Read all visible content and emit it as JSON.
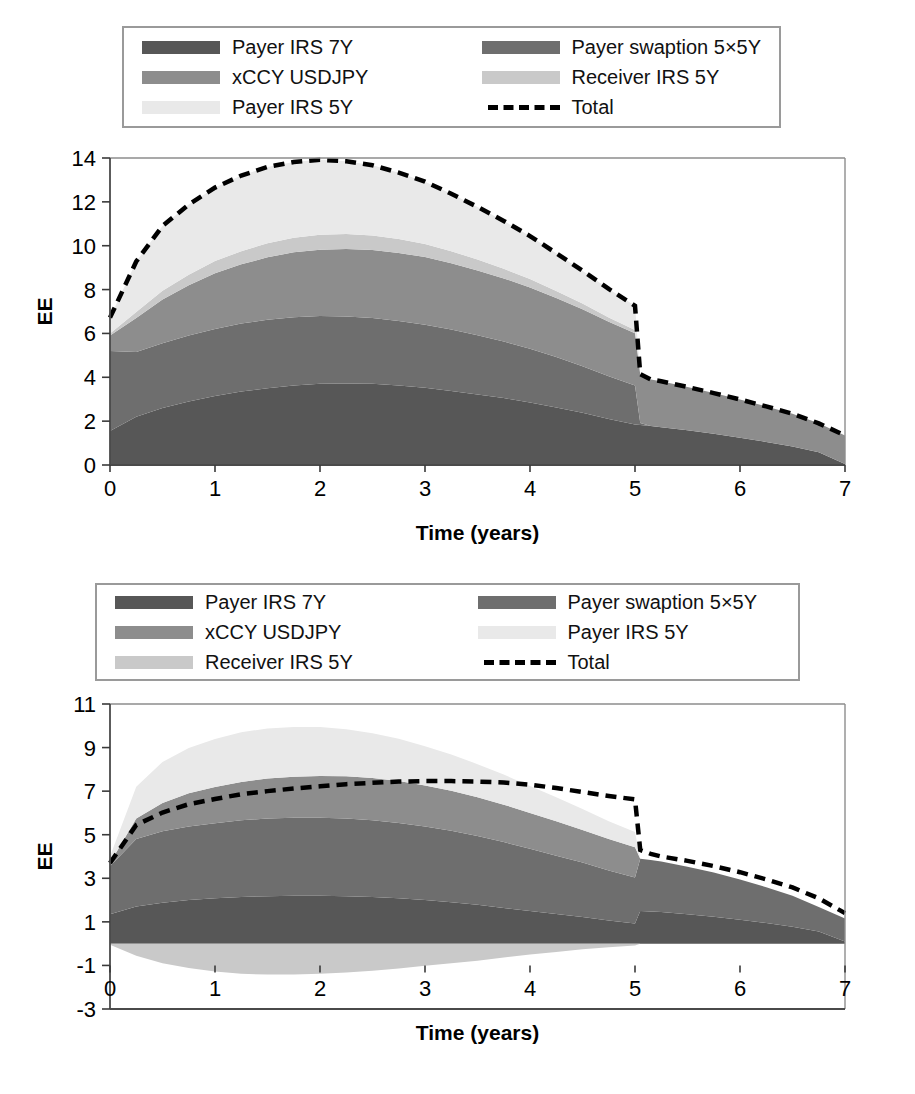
{
  "figure": {
    "axis_x_title": "Time (years)",
    "axis_y_title": "EE",
    "colors": {
      "payer_irs_7y": "#575757",
      "payer_swaption_5x5y": "#6e6e6e",
      "xccy_usdjpy": "#8d8d8d",
      "receiver_irs_5y": "#c9c9c9",
      "payer_irs_5y": "#e9e9e9",
      "total_line": "#000000",
      "frame": "#8d8d8d"
    }
  },
  "legend_top": {
    "items": [
      {
        "label": "Payer IRS 7Y",
        "swatch": "payer_irs_7y",
        "type": "fill"
      },
      {
        "label": "Payer swaption 5×5Y",
        "swatch": "payer_swaption_5x5y",
        "type": "fill"
      },
      {
        "label": "xCCY USDJPY",
        "swatch": "xccy_usdjpy",
        "type": "fill"
      },
      {
        "label": "Receiver IRS 5Y",
        "swatch": "receiver_irs_5y",
        "type": "fill"
      },
      {
        "label": "Payer IRS 5Y",
        "swatch": "payer_irs_5y",
        "type": "fill"
      },
      {
        "label": "Total",
        "swatch": "total_line",
        "type": "dashed-line"
      }
    ]
  },
  "legend_bottom": {
    "items": [
      {
        "label": "Payer IRS 7Y",
        "swatch": "payer_irs_7y",
        "type": "fill"
      },
      {
        "label": "Payer swaption 5×5Y",
        "swatch": "payer_swaption_5x5y",
        "type": "fill"
      },
      {
        "label": "xCCY USDJPY",
        "swatch": "xccy_usdjpy",
        "type": "fill"
      },
      {
        "label": "Payer IRS 5Y",
        "swatch": "payer_irs_5y",
        "type": "fill"
      },
      {
        "label": "Receiver IRS 5Y",
        "swatch": "receiver_irs_5y",
        "type": "fill"
      },
      {
        "label": "Total",
        "swatch": "total_line",
        "type": "dashed-line"
      }
    ]
  },
  "chart_data": [
    {
      "id": "chart-top",
      "type": "area",
      "stacked": true,
      "title": "",
      "xlabel": "Time (years)",
      "ylabel": "EE",
      "grid": false,
      "legend_position": "top",
      "xlim": [
        0,
        7
      ],
      "ylim": [
        0,
        14
      ],
      "xticks": [
        0,
        1,
        2,
        3,
        4,
        5,
        6,
        7
      ],
      "yticks": [
        0,
        2,
        4,
        6,
        8,
        10,
        12,
        14
      ],
      "x": [
        0,
        0.25,
        0.5,
        0.75,
        1.0,
        1.25,
        1.5,
        1.75,
        2.0,
        2.25,
        2.5,
        2.75,
        3.0,
        3.25,
        3.5,
        3.75,
        4.0,
        4.25,
        4.5,
        4.75,
        5.0,
        5.05,
        5.15,
        5.25,
        5.5,
        5.75,
        6.0,
        6.25,
        6.5,
        6.75,
        7.0
      ],
      "series": [
        {
          "name": "Payer IRS 7Y",
          "color_key": "payer_irs_7y",
          "values": [
            1.55,
            2.2,
            2.6,
            2.9,
            3.15,
            3.35,
            3.5,
            3.62,
            3.7,
            3.72,
            3.7,
            3.62,
            3.52,
            3.38,
            3.22,
            3.05,
            2.85,
            2.62,
            2.38,
            2.1,
            1.85,
            1.82,
            1.78,
            1.72,
            1.58,
            1.42,
            1.24,
            1.05,
            0.84,
            0.58,
            0.05
          ]
        },
        {
          "name": "Payer swaption 5×5Y",
          "color_key": "payer_swaption_5x5y",
          "values": [
            3.65,
            2.95,
            2.95,
            3.0,
            3.05,
            3.1,
            3.12,
            3.12,
            3.1,
            3.05,
            3.0,
            2.95,
            2.88,
            2.8,
            2.7,
            2.58,
            2.45,
            2.3,
            2.12,
            1.95,
            1.78,
            0.1,
            0.0,
            0.0,
            0.0,
            0.0,
            0.0,
            0.0,
            0.0,
            0.0,
            0.0
          ]
        },
        {
          "name": "xCCY USDJPY",
          "color_key": "xccy_usdjpy",
          "values": [
            0.7,
            1.55,
            2.0,
            2.3,
            2.55,
            2.7,
            2.85,
            2.96,
            3.02,
            3.08,
            3.1,
            3.1,
            3.08,
            3.02,
            2.95,
            2.88,
            2.8,
            2.7,
            2.6,
            2.48,
            2.38,
            2.22,
            2.12,
            2.1,
            1.98,
            1.86,
            1.75,
            1.62,
            1.5,
            1.32,
            1.3
          ]
        },
        {
          "name": "Receiver IRS 5Y",
          "color_key": "receiver_irs_5y",
          "values": [
            0.1,
            0.28,
            0.4,
            0.48,
            0.55,
            0.6,
            0.64,
            0.66,
            0.68,
            0.68,
            0.67,
            0.64,
            0.6,
            0.55,
            0.5,
            0.44,
            0.38,
            0.32,
            0.26,
            0.2,
            0.15,
            0.0,
            0.0,
            0.0,
            0.0,
            0.0,
            0.0,
            0.0,
            0.0,
            0.0,
            0.0
          ]
        },
        {
          "name": "Payer IRS 5Y",
          "color_key": "payer_irs_5y",
          "values": [
            0.72,
            2.3,
            2.95,
            3.2,
            3.35,
            3.45,
            3.48,
            3.46,
            3.42,
            3.32,
            3.2,
            3.02,
            2.84,
            2.62,
            2.4,
            2.18,
            1.96,
            1.72,
            1.5,
            1.3,
            1.1,
            0.0,
            0.0,
            0.0,
            0.0,
            0.0,
            0.0,
            0.0,
            0.0,
            0.0,
            0.0
          ]
        }
      ],
      "total": {
        "name": "Total",
        "style": "dashed",
        "values": [
          6.72,
          9.28,
          10.9,
          11.88,
          12.65,
          13.2,
          13.59,
          13.82,
          13.92,
          13.85,
          13.67,
          13.33,
          12.92,
          12.37,
          11.77,
          11.13,
          10.44,
          9.66,
          8.86,
          8.03,
          7.26,
          4.14,
          3.9,
          3.82,
          3.56,
          3.28,
          2.99,
          2.67,
          2.34,
          1.9,
          1.35
        ]
      }
    },
    {
      "id": "chart-bottom",
      "type": "area",
      "stacked": true,
      "title": "",
      "xlabel": "Time (years)",
      "ylabel": "EE",
      "grid": false,
      "legend_position": "top",
      "xlim": [
        0,
        7
      ],
      "ylim": [
        -3,
        11
      ],
      "xticks": [
        0,
        1,
        2,
        3,
        4,
        5,
        6,
        7
      ],
      "yticks": [
        -3,
        -1,
        1,
        3,
        5,
        7,
        9,
        11
      ],
      "x": [
        0,
        0.25,
        0.5,
        0.75,
        1.0,
        1.25,
        1.5,
        1.75,
        2.0,
        2.25,
        2.5,
        2.75,
        3.0,
        3.25,
        3.5,
        3.75,
        4.0,
        4.25,
        4.5,
        4.75,
        5.0,
        5.05,
        5.15,
        5.25,
        5.5,
        5.75,
        6.0,
        6.25,
        6.5,
        6.75,
        7.0
      ],
      "series": [
        {
          "name": "Payer IRS 7Y",
          "color_key": "payer_irs_7y",
          "values": [
            1.35,
            1.7,
            1.88,
            2.0,
            2.08,
            2.14,
            2.18,
            2.2,
            2.2,
            2.18,
            2.14,
            2.08,
            2.0,
            1.9,
            1.78,
            1.64,
            1.5,
            1.36,
            1.22,
            1.06,
            0.92,
            1.5,
            1.48,
            1.45,
            1.35,
            1.24,
            1.1,
            0.95,
            0.78,
            0.56,
            0.1
          ]
        },
        {
          "name": "Payer swaption 5×5Y",
          "color_key": "payer_swaption_5x5y",
          "values": [
            2.2,
            3.1,
            3.28,
            3.38,
            3.45,
            3.52,
            3.56,
            3.58,
            3.58,
            3.56,
            3.52,
            3.46,
            3.38,
            3.28,
            3.16,
            3.02,
            2.86,
            2.68,
            2.5,
            2.3,
            2.12,
            2.4,
            2.36,
            2.32,
            2.18,
            2.02,
            1.84,
            1.64,
            1.42,
            1.12,
            1.05
          ]
        },
        {
          "name": "xCCY USDJPY",
          "color_key": "xccy_usdjpy",
          "values": [
            0.15,
            0.95,
            1.3,
            1.52,
            1.66,
            1.76,
            1.84,
            1.88,
            1.92,
            1.94,
            1.94,
            1.92,
            1.88,
            1.84,
            1.78,
            1.72,
            1.64,
            1.58,
            1.5,
            1.44,
            1.38,
            0.0,
            0.0,
            0.0,
            0.0,
            0.0,
            0.0,
            0.0,
            0.0,
            0.0,
            0.0
          ]
        },
        {
          "name": "Payer IRS 5Y",
          "color_key": "payer_irs_5y",
          "values": [
            0.3,
            1.45,
            1.88,
            2.08,
            2.2,
            2.28,
            2.3,
            2.28,
            2.24,
            2.16,
            2.06,
            1.94,
            1.8,
            1.66,
            1.52,
            1.38,
            1.24,
            1.1,
            0.96,
            0.82,
            0.7,
            0.0,
            0.0,
            0.0,
            0.0,
            0.0,
            0.0,
            0.0,
            0.0,
            0.0,
            0.0
          ]
        },
        {
          "name": "Receiver IRS 5Y",
          "color_key": "receiver_irs_5y",
          "negative": true,
          "values": [
            -0.05,
            -0.55,
            -0.9,
            -1.12,
            -1.28,
            -1.38,
            -1.42,
            -1.42,
            -1.38,
            -1.32,
            -1.24,
            -1.14,
            -1.02,
            -0.9,
            -0.78,
            -0.64,
            -0.5,
            -0.38,
            -0.26,
            -0.16,
            -0.08,
            0.0,
            0.0,
            0.0,
            0.0,
            0.0,
            0.0,
            0.0,
            0.0,
            0.0,
            0.0
          ]
        }
      ],
      "total": {
        "name": "Total",
        "style": "dashed",
        "values": [
          3.7,
          5.45,
          6.02,
          6.4,
          6.64,
          6.86,
          7.0,
          7.12,
          7.22,
          7.32,
          7.38,
          7.44,
          7.46,
          7.46,
          7.44,
          7.4,
          7.3,
          7.14,
          6.96,
          6.78,
          6.62,
          4.3,
          4.12,
          4.0,
          3.8,
          3.56,
          3.28,
          2.95,
          2.58,
          2.08,
          1.4
        ]
      }
    }
  ]
}
